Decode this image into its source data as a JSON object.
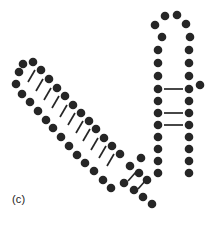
{
  "figure": {
    "panel_label": "(c)",
    "caption_text": "(c)",
    "background_color": "#ffffff",
    "nucleotide_color": "#262626",
    "bond_color": "#262626",
    "nucleotide_radius": 4.3,
    "bond_width": 1.7,
    "width": 207,
    "height": 227
  },
  "chart_data": {
    "type": "scatter",
    "title": "(c)",
    "xlabel": "",
    "ylabel": "",
    "xlim": [
      0,
      207
    ],
    "ylim": [
      227,
      0
    ],
    "grid": false,
    "legend": null,
    "series": [
      {
        "name": "nucleotides",
        "marker": "filled-circle",
        "color": "#262626",
        "points": [
          [
            19,
            72
          ],
          [
            16,
            84
          ],
          [
            22,
            94
          ],
          [
            30,
            102
          ],
          [
            38,
            111
          ],
          [
            46,
            120
          ],
          [
            53,
            128
          ],
          [
            61,
            137
          ],
          [
            69,
            146
          ],
          [
            77,
            155
          ],
          [
            85,
            163
          ],
          [
            94,
            171
          ],
          [
            103,
            180
          ],
          [
            111,
            188
          ],
          [
            23,
            64
          ],
          [
            33,
            62
          ],
          [
            41,
            70
          ],
          [
            49,
            79
          ],
          [
            57,
            88
          ],
          [
            65,
            96
          ],
          [
            73,
            105
          ],
          [
            81,
            113
          ],
          [
            89,
            121
          ],
          [
            96,
            129
          ],
          [
            104,
            138
          ],
          [
            112,
            146
          ],
          [
            120,
            154
          ],
          [
            130,
            166
          ],
          [
            139,
            173
          ],
          [
            147,
            180
          ],
          [
            124,
            183
          ],
          [
            134,
            190
          ],
          [
            143,
            197
          ],
          [
            152,
            204
          ],
          [
            141,
            158
          ],
          [
            162,
            37
          ],
          [
            158,
            50
          ],
          [
            158,
            63
          ],
          [
            158,
            76
          ],
          [
            158,
            89
          ],
          [
            158,
            101
          ],
          [
            158,
            113
          ],
          [
            158,
            125
          ],
          [
            158,
            137
          ],
          [
            158,
            149
          ],
          [
            158,
            161
          ],
          [
            158,
            173
          ],
          [
            155,
            25
          ],
          [
            165,
            16
          ],
          [
            177,
            15
          ],
          [
            186,
            24
          ],
          [
            190,
            37
          ],
          [
            189,
            50
          ],
          [
            189,
            63
          ],
          [
            189,
            76
          ],
          [
            189,
            89
          ],
          [
            189,
            101
          ],
          [
            189,
            113
          ],
          [
            189,
            125
          ],
          [
            189,
            137
          ],
          [
            189,
            149
          ],
          [
            189,
            161
          ],
          [
            189,
            173
          ],
          [
            200,
            85
          ]
        ]
      }
    ],
    "bonds": [
      {
        "name": "helix-bond",
        "x1": 35,
        "y1": 70,
        "x2": 28,
        "y2": 82
      },
      {
        "name": "helix-bond",
        "x1": 43,
        "y1": 79,
        "x2": 36,
        "y2": 91
      },
      {
        "name": "helix-bond",
        "x1": 51,
        "y1": 88,
        "x2": 44,
        "y2": 100
      },
      {
        "name": "helix-bond",
        "x1": 59,
        "y1": 96,
        "x2": 52,
        "y2": 108
      },
      {
        "name": "helix-bond",
        "x1": 67,
        "y1": 105,
        "x2": 60,
        "y2": 117
      },
      {
        "name": "helix-bond",
        "x1": 75,
        "y1": 113,
        "x2": 68,
        "y2": 125
      },
      {
        "name": "helix-bond",
        "x1": 83,
        "y1": 121,
        "x2": 76,
        "y2": 133
      },
      {
        "name": "helix-bond",
        "x1": 90,
        "y1": 129,
        "x2": 83,
        "y2": 141
      },
      {
        "name": "helix-bond",
        "x1": 98,
        "y1": 138,
        "x2": 91,
        "y2": 150
      },
      {
        "name": "helix-bond",
        "x1": 106,
        "y1": 146,
        "x2": 99,
        "y2": 158
      },
      {
        "name": "helix-bond",
        "x1": 114,
        "y1": 154,
        "x2": 107,
        "y2": 166
      },
      {
        "name": "junction-bond",
        "x1": 128,
        "y1": 181,
        "x2": 136,
        "y2": 172
      },
      {
        "name": "junction-bond",
        "x1": 138,
        "y1": 189,
        "x2": 146,
        "y2": 180
      },
      {
        "name": "pair-bond",
        "x1": 164,
        "y1": 89,
        "x2": 183,
        "y2": 89
      },
      {
        "name": "pair-bond",
        "x1": 164,
        "y1": 113,
        "x2": 183,
        "y2": 113
      },
      {
        "name": "pair-bond",
        "x1": 164,
        "y1": 125,
        "x2": 183,
        "y2": 125
      }
    ]
  }
}
